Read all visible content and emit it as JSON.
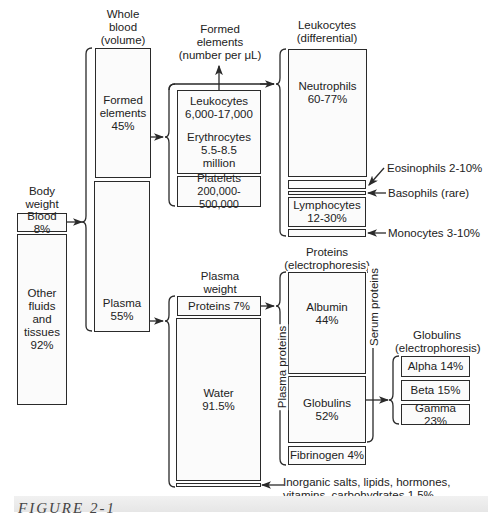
{
  "figure": {
    "caption": "FIGURE 2-1",
    "colors": {
      "line": "#2a2a2a",
      "box_fill": "#fbfbfb",
      "caption_bar": "#ececec"
    }
  },
  "body_weight": {
    "heading": [
      "Body",
      "weight"
    ],
    "blood": "Blood 8%",
    "other": [
      "Other",
      "fluids",
      "and",
      "tissues",
      "92%"
    ]
  },
  "whole_blood": {
    "heading": [
      "Whole",
      "blood",
      "(volume)"
    ],
    "formed": [
      "Formed",
      "elements",
      "45%"
    ],
    "plasma": [
      "Plasma",
      "55%"
    ]
  },
  "formed_elements": {
    "heading": [
      "Formed",
      "elements",
      "(number per μL)"
    ],
    "leukocytes": [
      "Leukocytes",
      "6,000-17,000"
    ],
    "erythrocytes": [
      "Erythrocytes",
      "5.5-8.5",
      "million"
    ],
    "platelets": [
      "Platelets",
      "200,000-500,000"
    ]
  },
  "leukocytes_differential": {
    "heading": [
      "Leukocytes",
      "(differential)"
    ],
    "neutrophils": [
      "Neutrophils",
      "60-77%"
    ],
    "eosinophils": "Eosinophils 2-10%",
    "basophils": "Basophils (rare)",
    "lymphocytes": [
      "Lymphocytes",
      "12-30%"
    ],
    "monocytes": "Monocytes 3-10%"
  },
  "plasma_weight": {
    "heading": [
      "Plasma",
      "weight"
    ],
    "proteins": "Proteins 7%",
    "water": [
      "Water",
      "91.5%"
    ],
    "other_note": [
      "Inorganic salts, lipids, hormones,",
      "vitamins, carbohydrates  1.5%"
    ]
  },
  "proteins": {
    "heading": [
      "Proteins",
      "(electrophoresis)"
    ],
    "albumin": [
      "Albumin",
      "44%"
    ],
    "globulins": [
      "Globulins",
      "52%"
    ],
    "fibrinogen": "Fibrinogen 4%",
    "plasma_proteins_label": "Plasma proteins",
    "serum_proteins_label": "Serum proteins"
  },
  "globulins": {
    "heading": [
      "Globulins",
      "(electrophoresis)"
    ],
    "alpha": "Alpha 14%",
    "beta": "Beta 15%",
    "gamma": "Gamma 23%"
  }
}
